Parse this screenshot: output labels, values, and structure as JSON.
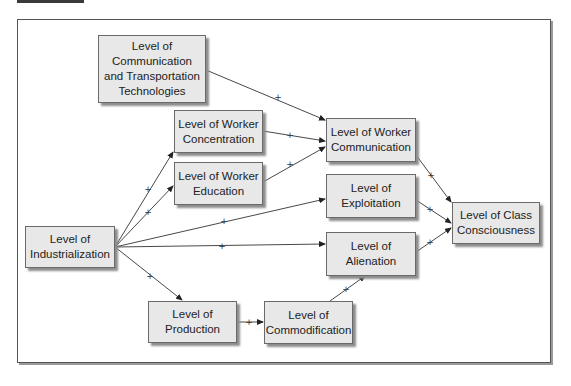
{
  "figure": {
    "frame_color": "#555555",
    "node_fill": "#e8e8e8",
    "edge_color": "#333333",
    "edge_label": "+"
  },
  "nodes": {
    "comm_transport": {
      "label": "Level of Communication and Transportation Technologies"
    },
    "worker_concentration": {
      "label": "Level of Worker Concentration"
    },
    "worker_education": {
      "label": "Level of Worker Education"
    },
    "worker_communication": {
      "label": "Level of Worker Communication"
    },
    "exploitation": {
      "label": "Level of Exploitation"
    },
    "alienation": {
      "label": "Level of Alienation"
    },
    "class_consciousness": {
      "label": "Level of Class Consciousness"
    },
    "industrialization": {
      "label": "Level of Industrialization"
    },
    "production": {
      "label": "Level of Production"
    },
    "commodification": {
      "label": "Level of Commodification"
    }
  },
  "edges": [
    {
      "from": "Level of Communication and Transportation Technologies",
      "to": "Level of Worker Communication",
      "sign": "+"
    },
    {
      "from": "Level of Worker Concentration",
      "to": "Level of Worker Communication",
      "sign": "+"
    },
    {
      "from": "Level of Worker Education",
      "to": "Level of Worker Communication",
      "sign": "+"
    },
    {
      "from": "Level of Worker Communication",
      "to": "Level of Class Consciousness",
      "sign": "+"
    },
    {
      "from": "Level of Exploitation",
      "to": "Level of Class Consciousness",
      "sign": "+"
    },
    {
      "from": "Level of Alienation",
      "to": "Level of Class Consciousness",
      "sign": "+"
    },
    {
      "from": "Level of Industrialization",
      "to": "Level of Worker Concentration",
      "sign": "+"
    },
    {
      "from": "Level of Industrialization",
      "to": "Level of Worker Education",
      "sign": "+"
    },
    {
      "from": "Level of Industrialization",
      "to": "Level of Exploitation",
      "sign": "+"
    },
    {
      "from": "Level of Industrialization",
      "to": "Level of Alienation",
      "sign": "+"
    },
    {
      "from": "Level of Industrialization",
      "to": "Level of Production",
      "sign": "+"
    },
    {
      "from": "Level of Production",
      "to": "Level of Commodification",
      "sign": "+"
    },
    {
      "from": "Level of Commodification",
      "to": "Level of Alienation",
      "sign": "+"
    }
  ],
  "labels": {
    "plus": "+"
  }
}
